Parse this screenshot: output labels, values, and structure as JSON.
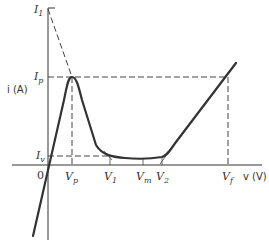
{
  "diagram": {
    "y_axis": {
      "label": "i (A)"
    },
    "x_axis": {
      "label": "v (V)",
      "origin": "0"
    },
    "current_labels": {
      "I1": {
        "main": "I",
        "sub": "1"
      },
      "Ip": {
        "main": "I",
        "sub": "p"
      },
      "Iv": {
        "main": "I",
        "sub": "v"
      }
    },
    "voltage_labels": {
      "Vp": {
        "main": "V",
        "sub": "p"
      },
      "V1": {
        "main": "V",
        "sub": "1"
      },
      "Vm": {
        "main": "V",
        "sub": "m"
      },
      "V2": {
        "main": "V",
        "sub": "2"
      },
      "Vf": {
        "main": "V",
        "sub": "f"
      }
    },
    "colors": {
      "curve": "#333333",
      "dashed": "#444444",
      "background": "#ffffff"
    }
  }
}
